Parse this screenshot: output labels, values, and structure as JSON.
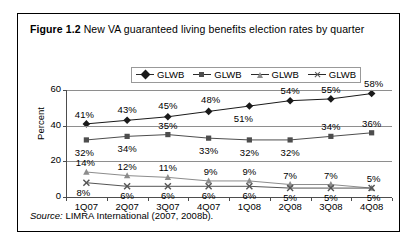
{
  "figure": {
    "number": "Figure 1.2",
    "title": "New VA guaranteed living benefits election rates by quarter",
    "source_label": "Source:",
    "source_text": "LIMRA International (2007, 2008b)."
  },
  "legend": {
    "items": [
      {
        "label": "GLWB",
        "marker": "diamond-marker"
      },
      {
        "label": "GLWB",
        "marker": "square-marker"
      },
      {
        "label": "GLWB",
        "marker": "triangle-marker"
      },
      {
        "label": "GLWB",
        "marker": "x-marker"
      }
    ]
  },
  "chart_data": {
    "type": "line",
    "title": "New VA guaranteed living benefits election rates by quarter",
    "xlabel": "",
    "ylabel": "Percent",
    "ylim": [
      0,
      60
    ],
    "yticks": [
      "0",
      "20",
      "40",
      "60"
    ],
    "grid": true,
    "legend_position": "top-center",
    "categories": [
      "1Q07",
      "2Q07",
      "3Q07",
      "4Q07",
      "1Q08",
      "2Q08",
      "3Q08",
      "4Q08"
    ],
    "series": [
      {
        "name": "GLWB",
        "marker": "diamond",
        "values": [
          41,
          43,
          45,
          48,
          51,
          54,
          55,
          58
        ],
        "labels": [
          "41%",
          "43%",
          "45%",
          "48%",
          "51%",
          "54%",
          "55%",
          "58%"
        ]
      },
      {
        "name": "GLWB",
        "marker": "square",
        "values": [
          32,
          34,
          35,
          33,
          32,
          32,
          34,
          36
        ],
        "labels": [
          "32%",
          "34%",
          "35%",
          "33%",
          "32%",
          "32%",
          "34%",
          "36%"
        ]
      },
      {
        "name": "GLWB",
        "marker": "triangle",
        "values": [
          14,
          12,
          11,
          9,
          9,
          7,
          7,
          5
        ],
        "labels": [
          "14%",
          "12%",
          "11%",
          "9%",
          "9%",
          "7%",
          "7%",
          "5%"
        ]
      },
      {
        "name": "GLWB",
        "marker": "x",
        "values": [
          8,
          6,
          6,
          6,
          6,
          5,
          5,
          5
        ],
        "labels": [
          "8%",
          "6%",
          "6%",
          "6%",
          "6%",
          "5%",
          "5%",
          "5%"
        ]
      }
    ]
  }
}
